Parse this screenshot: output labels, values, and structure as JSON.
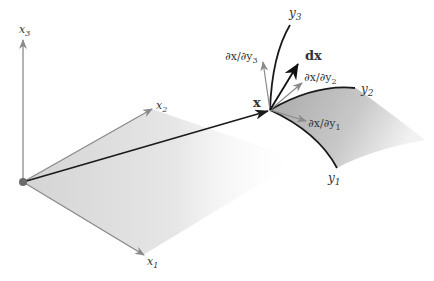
{
  "figure": {
    "cartesian_axes": {
      "x1": {
        "label": "x",
        "sub": "1"
      },
      "x2": {
        "label": "x",
        "sub": "2"
      },
      "x3": {
        "label": "x",
        "sub": "3"
      }
    },
    "point_label": "x",
    "curvilinear_axes": {
      "y1": {
        "label": "y",
        "sub": "1"
      },
      "y2": {
        "label": "y",
        "sub": "2"
      },
      "y3": {
        "label": "y",
        "sub": "3"
      }
    },
    "tangent_vectors": {
      "dy1": {
        "num": "∂x/∂y",
        "sub": "1"
      },
      "dy2": {
        "num": "∂x/∂y",
        "sub": "2"
      },
      "dy3": {
        "num": "∂x/∂y",
        "sub": "3"
      }
    },
    "differential_label": "dx",
    "colors": {
      "axis_gray": "#8a8a8a",
      "vector_dark": "#1a1a1a",
      "plane_gray": "#d8d8d8",
      "surface_gray": "#b8b8b8",
      "origin_dot": "#6a6a6a"
    }
  }
}
